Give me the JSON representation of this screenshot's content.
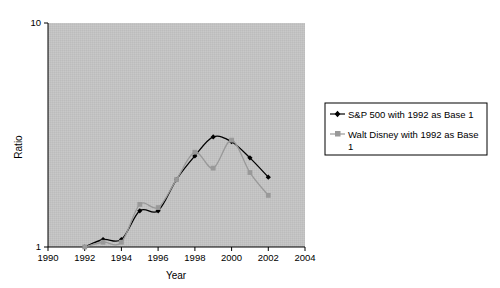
{
  "chart_data": {
    "type": "line",
    "title": "",
    "xlabel": "Year",
    "ylabel": "Ratio",
    "yscale": "log",
    "ylim": [
      1,
      10
    ],
    "ytick_labels": [
      "10",
      "1"
    ],
    "ytick_values": [
      10,
      1
    ],
    "xlim": [
      1990,
      2004
    ],
    "xtick_labels": [
      "1990",
      "1992",
      "1994",
      "1996",
      "1998",
      "2000",
      "2002",
      "2004"
    ],
    "xtick_values": [
      1990,
      1992,
      1994,
      1996,
      1998,
      2000,
      2002,
      2004
    ],
    "x": [
      1992,
      1993,
      1994,
      1995,
      1996,
      1997,
      1998,
      1999,
      2000,
      2001,
      2002
    ],
    "grid": false,
    "plot_background": "#c0c0c0",
    "legend_position": "right-outside",
    "series": [
      {
        "name": "S&P 500 with 1992 as Base 1",
        "color": "#000000",
        "marker": "diamond",
        "values": [
          1.0,
          1.08,
          1.08,
          1.45,
          1.45,
          2.0,
          2.55,
          3.1,
          2.95,
          2.5,
          2.05
        ]
      },
      {
        "name": "Walt Disney with 1992 as Base 1",
        "color": "#999999",
        "marker": "square",
        "values": [
          1.0,
          1.05,
          1.05,
          1.55,
          1.5,
          2.0,
          2.65,
          2.25,
          3.0,
          2.15,
          1.7
        ]
      }
    ]
  },
  "legend": {
    "entries": [
      {
        "label": "S&P 500 with 1992 as Base 1"
      },
      {
        "label": "Walt Disney with 1992 as Base 1"
      }
    ]
  },
  "axes": {
    "y_title": "Ratio",
    "x_title": "Year"
  }
}
